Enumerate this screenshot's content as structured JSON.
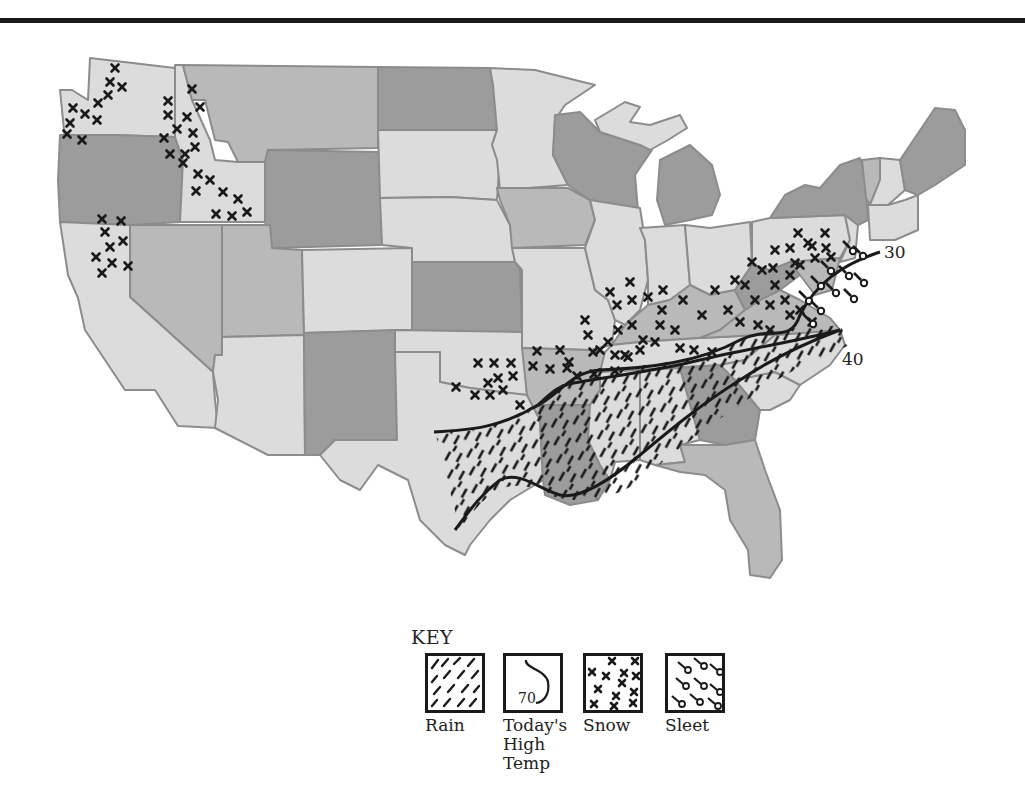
{
  "map": {
    "title": "",
    "colors": {
      "dark": "#9c9c9c",
      "medium": "#b9b9b9",
      "light": "#dcdcdc",
      "border": "#8c8c8c",
      "ink": "#1a1a1a"
    },
    "isotherms": [
      {
        "value": "30",
        "label": "30"
      },
      {
        "value": "40",
        "label": "40"
      }
    ],
    "precipitation_regions": [
      {
        "type": "Snow",
        "areas": [
          "Washington",
          "Idaho",
          "Northern California",
          "Oklahoma",
          "Missouri",
          "Illinois",
          "Indiana",
          "Ohio",
          "Kentucky",
          "West Virginia",
          "Pennsylvania",
          "Virginia"
        ]
      },
      {
        "type": "Sleet",
        "areas": [
          "Maryland",
          "Delaware",
          "New Jersey",
          "Eastern Virginia"
        ]
      },
      {
        "type": "Rain",
        "areas": [
          "Texas",
          "Louisiana",
          "Arkansas",
          "Mississippi",
          "Alabama",
          "Tennessee",
          "North Carolina"
        ]
      }
    ]
  },
  "key": {
    "title": "KEY",
    "items": [
      {
        "symbol": "rain",
        "label": "Rain"
      },
      {
        "symbol": "high-temp",
        "label": "Today's High Temp",
        "sample_value": "70",
        "label_lines": [
          "Today's",
          "High",
          "Temp"
        ]
      },
      {
        "symbol": "snow",
        "label": "Snow"
      },
      {
        "symbol": "sleet",
        "label": "Sleet"
      }
    ]
  }
}
